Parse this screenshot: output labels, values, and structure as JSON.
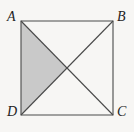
{
  "figure": {
    "type": "geometry-diagram",
    "shape": "square",
    "background_color": "#f7f6f4",
    "line_color": "#4a4a4a",
    "shade_color": "#c9c9c9",
    "label_color": "#232323",
    "vertices": [
      {
        "id": "A",
        "label": "A",
        "position": "top-left",
        "x": 21,
        "y": 21
      },
      {
        "id": "B",
        "label": "B",
        "position": "top-right",
        "x": 113,
        "y": 21
      },
      {
        "id": "C",
        "label": "C",
        "position": "bottom-right",
        "x": 113,
        "y": 115
      },
      {
        "id": "D",
        "label": "D",
        "position": "bottom-left",
        "x": 21,
        "y": 115
      }
    ],
    "center": {
      "label": "",
      "x": 67,
      "y": 68
    },
    "edges": [
      {
        "from": "A",
        "to": "B"
      },
      {
        "from": "B",
        "to": "C"
      },
      {
        "from": "C",
        "to": "D"
      },
      {
        "from": "D",
        "to": "A"
      }
    ],
    "diagonals": [
      {
        "from": "A",
        "to": "C"
      },
      {
        "from": "B",
        "to": "D"
      }
    ],
    "shaded_region": {
      "name": "triangle-A-center-D",
      "vertices": [
        "A",
        "center",
        "D"
      ],
      "fill": "#c9c9c9"
    }
  }
}
